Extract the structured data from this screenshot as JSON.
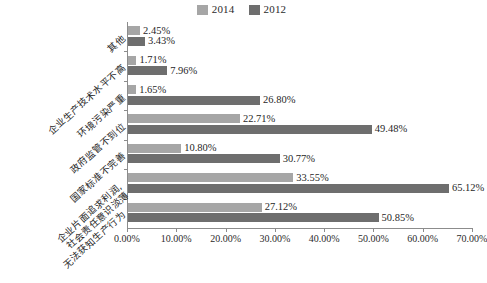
{
  "chart_data": {
    "type": "bar",
    "orientation": "horizontal",
    "title": "",
    "subtitle": "",
    "xlabel": "",
    "ylabel": "",
    "xlim": [
      0,
      70
    ],
    "grid": false,
    "legend_position": "top-center",
    "categories": [
      "其他",
      "企业生产技术水平不高",
      "环境污染严重",
      "政府监管不到位",
      "国家标准不完善",
      "企业片面追求利润,\n社会责任意识淡薄",
      "无法获知生产行为"
    ],
    "series": [
      {
        "name": "2014",
        "color": "#a6a6a6",
        "values": [
          2.45,
          1.71,
          1.65,
          22.71,
          10.8,
          33.55,
          27.12
        ],
        "labels": [
          "2.45%",
          "1.71%",
          "1.65%",
          "22.71%",
          "10.80%",
          "33.55%",
          "27.12%"
        ]
      },
      {
        "name": "2012",
        "color": "#6e6e6e",
        "values": [
          3.43,
          7.96,
          26.8,
          49.48,
          30.77,
          65.12,
          50.85
        ],
        "labels": [
          "3.43%",
          "7.96%",
          "26.80%",
          "49.48%",
          "30.77%",
          "65.12%",
          "50.85%"
        ]
      }
    ],
    "xticks": [
      0,
      10,
      20,
      30,
      40,
      50,
      60,
      70
    ],
    "xtick_labels": [
      "0.00%",
      "10.00%",
      "20.00%",
      "30.00%",
      "40.00%",
      "50.00%",
      "60.00%",
      "70.00%"
    ]
  },
  "legend": {
    "entries": [
      {
        "label": "2014",
        "color": "#a6a6a6"
      },
      {
        "label": "2012",
        "color": "#6e6e6e"
      }
    ]
  },
  "axis": {
    "line_color": "#8c8c8c"
  }
}
